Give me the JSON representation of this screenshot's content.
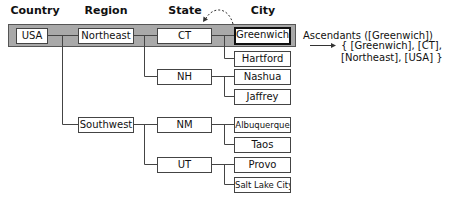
{
  "headers": {
    "country": "Country",
    "region": "Region",
    "state": "State",
    "city": "City"
  },
  "nodes": {
    "usa": "USA",
    "northeast": "Northeast",
    "southwest": "Southwest",
    "ct": "CT",
    "nh": "NH",
    "nm": "NM",
    "ut": "UT",
    "greenwich": "Greenwich",
    "hartford": "Hartford",
    "nashua": "Nashua",
    "jaffrey": "Jaffrey",
    "albuquerque": "Albuquerque",
    "taos": "Taos",
    "provo": "Provo",
    "salt_lake_city": "Salt Lake City"
  },
  "annotation": {
    "line1": "Ascendants ([Greenwich])",
    "line2": "{ [Greenwich], [CT],",
    "line3": "[Northeast], [USA] }"
  },
  "colors": {
    "highlight_band": "#a9a9a9",
    "lines": "#444444"
  }
}
